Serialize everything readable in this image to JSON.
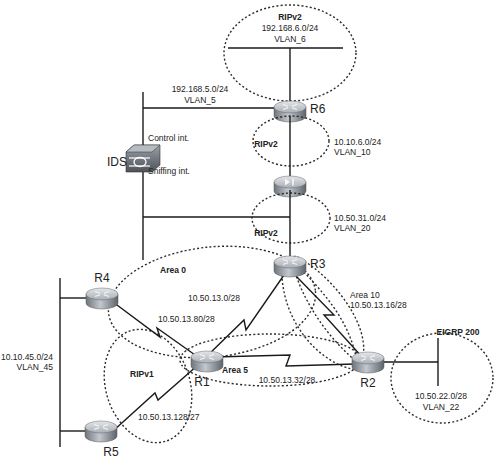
{
  "colors": {
    "line": "#1a1a1a",
    "router_top": "#c9cdd3",
    "router_side": "#8a9098",
    "background": "#ffffff"
  },
  "devices": {
    "r6": {
      "label": "R6",
      "icon": "router-icon"
    },
    "r3": {
      "label": "R3",
      "icon": "router-icon"
    },
    "r4": {
      "label": "R4",
      "icon": "router-icon"
    },
    "r1": {
      "label": "R1",
      "icon": "router-icon"
    },
    "r2": {
      "label": "R2",
      "icon": "router-icon"
    },
    "r5": {
      "label": "R5",
      "icon": "router-icon"
    },
    "firewall": {
      "label": "",
      "icon": "firewall-icon"
    },
    "ids": {
      "label": "IDS",
      "icon": "ids-sensor-icon",
      "control_if": "Control int.",
      "sniffing_if": "Sniffing int."
    }
  },
  "networks": {
    "vlan6": {
      "protocol": "RIPv2",
      "subnet": "192.168.6.0/24",
      "vlan": "VLAN_6"
    },
    "vlan5": {
      "subnet": "192.168.5.0/24",
      "vlan": "VLAN_5"
    },
    "vlan10": {
      "protocol": "RIPv2",
      "subnet": "10.10.6.0/24",
      "vlan": "VLAN_10"
    },
    "vlan20": {
      "protocol": "RIPv2",
      "subnet": "10.50.31.0/24",
      "vlan": "VLAN_20"
    },
    "vlan45": {
      "subnet": "10.10.45.0/24",
      "vlan": "VLAN_45"
    },
    "vlan22": {
      "protocol": "EIGRP 200",
      "subnet": "10.50.22.0/28",
      "vlan": "VLAN_22"
    }
  },
  "links": {
    "r4_r1": {
      "subnet": "10.50.13.80/28"
    },
    "r1_r3": {
      "subnet": "10.50.13.0/28"
    },
    "r3_r2": {
      "area": "Area 10",
      "subnet": "10.50.13.16/28"
    },
    "r1_r2": {
      "subnet": "10.50.13.32/28"
    },
    "r5_r1": {
      "protocol": "RIPv1",
      "subnet": "10.50.13.128/27"
    }
  },
  "areas": {
    "area0": "Area 0",
    "area5": "Area 5"
  }
}
